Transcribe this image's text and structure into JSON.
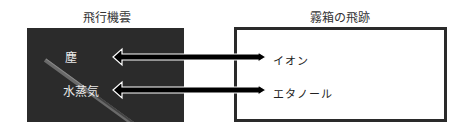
{
  "left_panel": {
    "title": "飛行機雲",
    "labels": [
      "塵",
      "水蒸気"
    ],
    "background": "#2b2b2b"
  },
  "right_panel": {
    "title": "霧箱の飛跡",
    "labels": [
      "イオン",
      "エタノール"
    ],
    "border_color": "#2a2a2a"
  },
  "arrows": [
    {
      "from": "塵",
      "to": "イオン",
      "type": "bidirectional"
    },
    {
      "from": "水蒸気",
      "to": "エタノール",
      "type": "bidirectional"
    }
  ]
}
